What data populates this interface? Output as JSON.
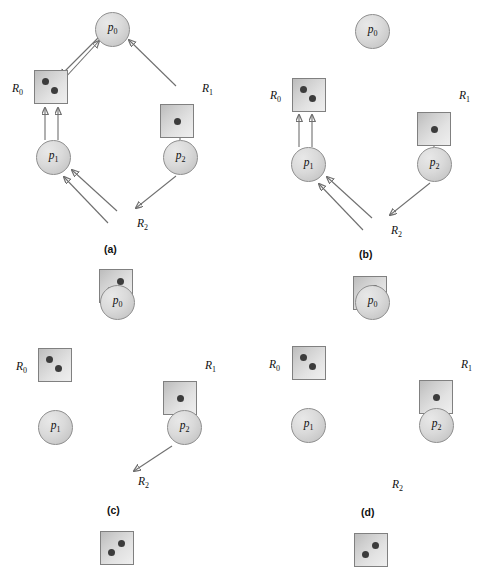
{
  "figure": {
    "clipped_header": "",
    "width": 494,
    "height": 546,
    "colors": {
      "background": "#ffffff",
      "process_fill": "#dadada",
      "process_stroke": "#8e8e8e",
      "resource_fill_light": "#efefef",
      "resource_fill_dark": "#bcbcbc",
      "resource_stroke": "#808080",
      "instance_dot": "#3c3c3c",
      "edge_stroke": "#6f6f6f",
      "text": "#111111"
    }
  },
  "panels": [
    {
      "id": "a",
      "caption": "(a)",
      "processes": [
        {
          "name": "p0",
          "label": "p",
          "sub": "0"
        },
        {
          "name": "p1",
          "label": "p",
          "sub": "1"
        },
        {
          "name": "p2",
          "label": "p",
          "sub": "2"
        }
      ],
      "resources": [
        {
          "name": "R0",
          "label": "R",
          "sub": "0",
          "instances": 2
        },
        {
          "name": "R1",
          "label": "R",
          "sub": "1",
          "instances": 1
        },
        {
          "name": "R2",
          "label": "R",
          "sub": "2",
          "instances": 2
        }
      ],
      "edges": [
        {
          "from": "R0",
          "to": "p0",
          "kind": "assignment"
        },
        {
          "from": "p0",
          "to": "R0",
          "kind": "request"
        },
        {
          "from": "R1",
          "to": "p0",
          "kind": "assignment"
        },
        {
          "from": "p1",
          "to": "R0",
          "kind": "request"
        },
        {
          "from": "p1",
          "to": "R0",
          "kind": "request"
        },
        {
          "from": "p2",
          "to": "R1",
          "kind": "request"
        },
        {
          "from": "R2",
          "to": "p1",
          "kind": "assignment"
        },
        {
          "from": "R2",
          "to": "p1",
          "kind": "assignment"
        },
        {
          "from": "p2",
          "to": "R2",
          "kind": "request"
        }
      ]
    },
    {
      "id": "b",
      "caption": "(b)",
      "processes": [
        {
          "name": "p0",
          "label": "p",
          "sub": "0"
        },
        {
          "name": "p1",
          "label": "p",
          "sub": "1"
        },
        {
          "name": "p2",
          "label": "p",
          "sub": "2"
        }
      ],
      "resources": [
        {
          "name": "R0",
          "label": "R",
          "sub": "0",
          "instances": 2
        },
        {
          "name": "R1",
          "label": "R",
          "sub": "1",
          "instances": 1
        },
        {
          "name": "R2",
          "label": "R",
          "sub": "2",
          "instances": 2
        }
      ],
      "edges": [
        {
          "from": "p1",
          "to": "R0",
          "kind": "request"
        },
        {
          "from": "p1",
          "to": "R0",
          "kind": "request"
        },
        {
          "from": "p2",
          "to": "R1",
          "kind": "request"
        },
        {
          "from": "R2",
          "to": "p1",
          "kind": "assignment"
        },
        {
          "from": "R2",
          "to": "p1",
          "kind": "assignment"
        },
        {
          "from": "p2",
          "to": "R2",
          "kind": "request"
        }
      ]
    },
    {
      "id": "c",
      "caption": "(c)",
      "processes": [
        {
          "name": "p0",
          "label": "p",
          "sub": "0"
        },
        {
          "name": "p1",
          "label": "p",
          "sub": "1"
        },
        {
          "name": "p2",
          "label": "p",
          "sub": "2"
        }
      ],
      "resources": [
        {
          "name": "R0",
          "label": "R",
          "sub": "0",
          "instances": 2
        },
        {
          "name": "R1",
          "label": "R",
          "sub": "1",
          "instances": 1
        },
        {
          "name": "R2",
          "label": "R",
          "sub": "2",
          "instances": 2
        }
      ],
      "edges": [
        {
          "from": "p2",
          "to": "R1",
          "kind": "request"
        },
        {
          "from": "p2",
          "to": "R2",
          "kind": "request"
        }
      ]
    },
    {
      "id": "d",
      "caption": "(d)",
      "processes": [
        {
          "name": "p0",
          "label": "p",
          "sub": "0"
        },
        {
          "name": "p1",
          "label": "p",
          "sub": "1"
        },
        {
          "name": "p2",
          "label": "p",
          "sub": "2"
        }
      ],
      "resources": [
        {
          "name": "R0",
          "label": "R",
          "sub": "0",
          "instances": 2
        },
        {
          "name": "R1",
          "label": "R",
          "sub": "1",
          "instances": 1
        },
        {
          "name": "R2",
          "label": "R",
          "sub": "2",
          "instances": 2
        }
      ],
      "edges": []
    }
  ]
}
